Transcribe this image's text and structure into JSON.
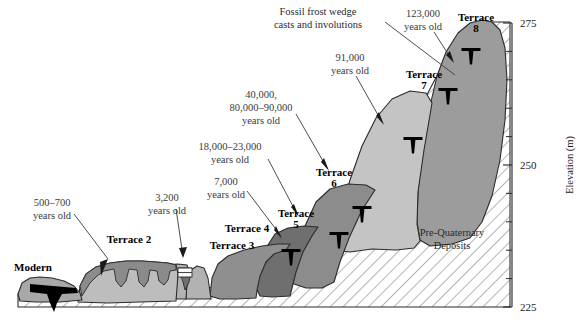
{
  "figure": {
    "type": "geologic-cross-section",
    "axis": {
      "label": "Elevation (m)",
      "unit": "m",
      "min": 225,
      "max": 275,
      "major_ticks": [
        "275",
        "250",
        "225"
      ],
      "major_tick_values": [
        275,
        250,
        225
      ],
      "minor_tick_interval": 5,
      "minor_tick_values": [
        270,
        265,
        260,
        255,
        245,
        240,
        235,
        230
      ],
      "position": "right"
    },
    "units": [
      {
        "id": "modern",
        "label": "Modern",
        "age": "",
        "fill": "#a8a8a8"
      },
      {
        "id": "terrace2",
        "label": "Terrace 2",
        "age": "500–700 years old",
        "fill": "#bdbdbd"
      },
      {
        "id": "terrace3",
        "label": "Terrace 3",
        "age": "3,200 years old",
        "fill": "#b2b2b2"
      },
      {
        "id": "terrace4",
        "label": "Terrace 4",
        "age": "7,000 years old",
        "fill": "#8f8f8f"
      },
      {
        "id": "terrace5",
        "label": "Terrace 5",
        "age": "18,000–23,000 years old",
        "fill": "#6f6f6f"
      },
      {
        "id": "terrace6",
        "label": "Terrace 6",
        "age": "40,000, 80,000–90,000 years old",
        "fill": "#8c8c8c"
      },
      {
        "id": "terrace7",
        "label": "Terrace 7",
        "age": "91,000 years old",
        "fill": "#c4c4c4"
      },
      {
        "id": "terrace8",
        "label": "Terrace 8",
        "age": "123,000 years old",
        "fill": "#9c9c9c"
      },
      {
        "id": "bedrock",
        "label": "Pre-Quaternary Deposits",
        "age": "",
        "fill": "#ffffff"
      }
    ],
    "terrace_labels": [
      {
        "text": "Modern",
        "x": 33,
        "y": 271
      },
      {
        "text": "Terrace 2",
        "x": 129,
        "y": 243
      },
      {
        "text": "Terrace 3",
        "x": 232,
        "y": 249
      },
      {
        "text": "Terrace 4",
        "x": 243,
        "y": 232
      },
      {
        "text": "Terrace 5",
        "x": 296,
        "y": 217
      },
      {
        "text": "Terrace 6",
        "x": 332,
        "y": 176
      },
      {
        "text": "Terrace 7",
        "x": 420,
        "y": 78
      },
      {
        "text": "Terrace 8",
        "x": 472,
        "y": 21
      }
    ],
    "age_labels": [
      {
        "lines": [
          "500–700",
          "years old"
        ],
        "x": 50,
        "y": 206,
        "anchor": "middle"
      },
      {
        "lines": [
          "3,200",
          "years old"
        ],
        "x": 167,
        "y": 201,
        "anchor": "middle"
      },
      {
        "lines": [
          "7,000",
          "years old"
        ],
        "x": 227,
        "y": 185,
        "anchor": "middle"
      },
      {
        "lines": [
          "18,000–23,000",
          "years old"
        ],
        "x": 230,
        "y": 150,
        "anchor": "middle"
      },
      {
        "lines": [
          "40,000,",
          "80,000–90,000",
          "years old"
        ],
        "x": 261,
        "y": 98,
        "anchor": "middle"
      },
      {
        "lines": [
          "91,000",
          "years old"
        ],
        "x": 350,
        "y": 61,
        "anchor": "middle"
      },
      {
        "lines": [
          "123,000",
          "years old"
        ],
        "x": 421,
        "y": 17,
        "anchor": "middle"
      }
    ],
    "annotations": [
      {
        "id": "frost-wedge-note",
        "lines": [
          "Fossil frost wedge",
          "casts and involutions"
        ],
        "x": 338,
        "y": 15,
        "anchor": "middle"
      },
      {
        "id": "bedrock-note",
        "lines": [
          "Pre-Quaternary",
          "Deposits"
        ],
        "x": 452,
        "y": 236,
        "anchor": "middle"
      }
    ],
    "frost_wedge_symbols": [
      {
        "x": 291,
        "y": 257
      },
      {
        "x": 339,
        "y": 240
      },
      {
        "x": 362,
        "y": 214
      },
      {
        "x": 413,
        "y": 145
      },
      {
        "x": 448,
        "y": 96
      },
      {
        "x": 471,
        "y": 56
      }
    ]
  }
}
